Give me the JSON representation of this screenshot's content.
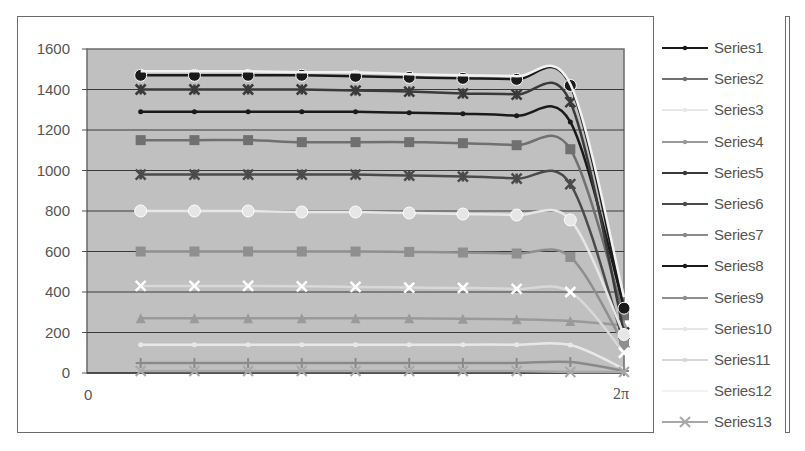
{
  "chart_data": {
    "type": "line",
    "title": "",
    "xlabel": "",
    "ylabel": "",
    "ylim": [
      0,
      1600
    ],
    "yticks": [
      0,
      200,
      400,
      600,
      800,
      1000,
      1200,
      1400,
      1600
    ],
    "xtick_labels": [
      "0",
      "2π"
    ],
    "x": [
      0.628,
      1.257,
      1.885,
      2.513,
      3.142,
      3.77,
      4.398,
      5.027,
      5.655,
      6.283
    ],
    "grid": true,
    "legend_position": "right",
    "plot_background": "#c0c0c0",
    "series": [
      {
        "name": "Series1",
        "values": [
          1290,
          1290,
          1290,
          1290,
          1290,
          1285,
          1280,
          1270,
          1240,
          325
        ]
      },
      {
        "name": "Series2",
        "values": [
          1150,
          1150,
          1150,
          1140,
          1140,
          1140,
          1135,
          1125,
          1105,
          285
        ]
      },
      {
        "name": "Series3",
        "values": [
          140,
          140,
          140,
          140,
          140,
          140,
          140,
          140,
          138,
          20
        ]
      },
      {
        "name": "Series4",
        "values": [
          270,
          270,
          270,
          270,
          270,
          270,
          268,
          265,
          257,
          235
        ]
      },
      {
        "name": "Series5",
        "values": [
          1400,
          1400,
          1400,
          1400,
          1395,
          1390,
          1380,
          1375,
          1338,
          200
        ]
      },
      {
        "name": "Series6",
        "values": [
          980,
          980,
          980,
          980,
          980,
          975,
          970,
          960,
          933,
          150
        ]
      },
      {
        "name": "Series7",
        "values": [
          50,
          50,
          50,
          50,
          50,
          50,
          50,
          50,
          54,
          10
        ]
      },
      {
        "name": "Series8",
        "values": [
          1470,
          1470,
          1470,
          1470,
          1465,
          1460,
          1455,
          1450,
          1420,
          320
        ]
      },
      {
        "name": "Series9",
        "values": [
          600,
          600,
          600,
          600,
          600,
          598,
          595,
          590,
          573,
          140
        ]
      },
      {
        "name": "Series10",
        "values": [
          800,
          800,
          800,
          795,
          795,
          790,
          785,
          780,
          756,
          190
        ]
      },
      {
        "name": "Series11",
        "values": [
          430,
          430,
          430,
          428,
          425,
          422,
          420,
          415,
          400,
          100
        ]
      },
      {
        "name": "Series12",
        "values": [
          1490,
          1490,
          1490,
          1485,
          1485,
          1475,
          1470,
          1465,
          1427,
          375
        ]
      },
      {
        "name": "Series13",
        "values": [
          10,
          10,
          10,
          10,
          10,
          10,
          10,
          10,
          5,
          5
        ]
      }
    ]
  },
  "legend": {
    "items": [
      {
        "label": "Series1",
        "color": "#1a1a1a",
        "marker": "dot"
      },
      {
        "label": "Series2",
        "color": "#707070",
        "marker": "square"
      },
      {
        "label": "Series3",
        "color": "#e8e8e8",
        "marker": "dot"
      },
      {
        "label": "Series4",
        "color": "#9a9a9a",
        "marker": "tri"
      },
      {
        "label": "Series5",
        "color": "#3a3a3a",
        "marker": "asterisk"
      },
      {
        "label": "Series6",
        "color": "#4a4a4a",
        "marker": "asterisk"
      },
      {
        "label": "Series7",
        "color": "#8a8a8a",
        "marker": "plus"
      },
      {
        "label": "Series8",
        "color": "#1a1a1a",
        "marker": "circle"
      },
      {
        "label": "Series9",
        "color": "#8f8f8f",
        "marker": "square"
      },
      {
        "label": "Series10",
        "color": "#e6e6e6",
        "marker": "circle"
      },
      {
        "label": "Series11",
        "color": "#d8d8d8",
        "marker": "dash"
      },
      {
        "label": "Series12",
        "color": "#f2f2f2",
        "marker": "none"
      },
      {
        "label": "Series13",
        "color": "#a8a8a8",
        "marker": "x"
      }
    ]
  },
  "axes": {
    "y_labels": [
      "1600",
      "1400",
      "1200",
      "1000",
      "800",
      "600",
      "400",
      "200",
      "0"
    ],
    "x_labels": {
      "start": "0",
      "end": "2π"
    }
  }
}
